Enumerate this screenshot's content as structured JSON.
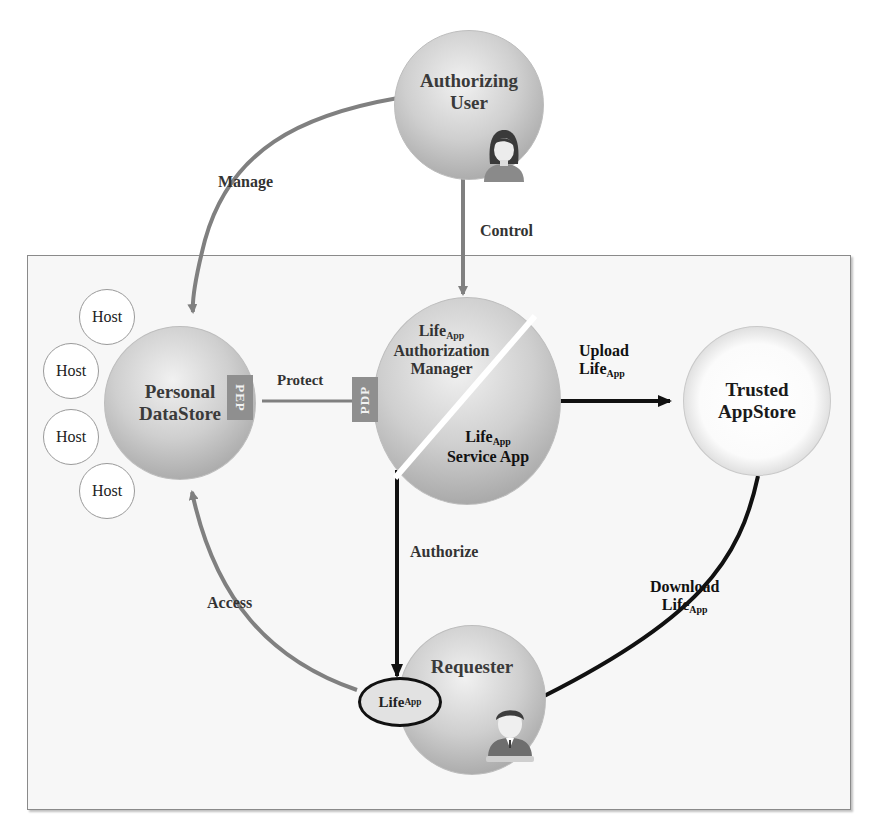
{
  "diagram": {
    "title": "",
    "nodes": {
      "authorizing_user": {
        "line1": "Authorizing",
        "line2": "User",
        "icon": "female-user-icon"
      },
      "personal_datastore": {
        "line1": "Personal",
        "line2": "DataStore"
      },
      "authorization_manager": {
        "name": "Life",
        "sub": "App",
        "line2": "Authorization",
        "line3": "Manager"
      },
      "service_app": {
        "name": "Life",
        "sub": "App",
        "line2": "Service App"
      },
      "trusted_appstore": {
        "line1": "Trusted",
        "line2": "AppStore"
      },
      "requester": {
        "label": "Requester",
        "icon": "male-user-icon"
      },
      "lifeapp_oval": {
        "name": "Life",
        "sub": "App"
      }
    },
    "hosts": [
      "Host",
      "Host",
      "Host",
      "Host"
    ],
    "tags": {
      "pep": "PEP",
      "pdp": "PDP"
    },
    "edges": {
      "manage": "Manage",
      "control": "Control",
      "protect": "Protect",
      "upload": {
        "line1": "Upload",
        "name": "Life",
        "sub": "App"
      },
      "download": {
        "line1": "Download",
        "name": "Life",
        "sub": "App"
      },
      "authorize": "Authorize",
      "access": "Access"
    },
    "colors": {
      "grey_edge": "#808080",
      "black_edge": "#111111",
      "tag_fill": "#8f8f8f",
      "frame_border": "#8a8a8a"
    }
  }
}
